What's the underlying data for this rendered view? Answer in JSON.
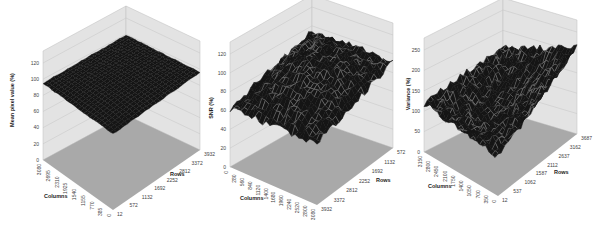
{
  "colors": {
    "wall": "#e3e3e3",
    "wall_edge": "#bdbdbd",
    "gridline": "#c4c4c4",
    "floor": "#a9a9a9",
    "surface": "#151515",
    "surface_speckle": "#7a7a7a",
    "tick_text": "#444444"
  },
  "chart_data": [
    {
      "type": "surface3d",
      "title": "",
      "zlabel": "Mean pixel value (%)",
      "xlabel": "Columns",
      "ylabel": "Rows",
      "zlim": [
        0,
        120
      ],
      "z_ticks": [
        "0",
        "20",
        "40",
        "60",
        "80",
        "100",
        "120"
      ],
      "x_ticks": [
        "3080",
        "2695",
        "2310",
        "1925",
        "1540",
        "1155",
        "770",
        "385",
        "0"
      ],
      "y_ticks": [
        "12",
        "572",
        "1132",
        "1692",
        "2252",
        "2812",
        "3372",
        "3932"
      ],
      "surface_description": "Nearly flat dome; ~95% at edges rising to ~100% near center",
      "approx_corner_values": {
        "left": 95,
        "back": 99,
        "right": 96,
        "front": 94
      },
      "approx_center_value": 100
    },
    {
      "type": "surface3d",
      "title": "",
      "zlabel": "SNR (%)",
      "xlabel": "Columns",
      "ylabel": "Rows",
      "zlim": [
        0,
        120
      ],
      "z_ticks": [
        "0",
        "20",
        "40",
        "60",
        "80",
        "100",
        "120"
      ],
      "x_ticks": [
        "0",
        "280",
        "560",
        "840",
        "1120",
        "1400",
        "1680",
        "1960",
        "2240",
        "2520",
        "2800",
        "3080"
      ],
      "y_ticks": [
        "3932",
        "3372",
        "2812",
        "2252",
        "1692",
        "1132",
        "572"
      ],
      "surface_description": "Noisy dome; ~62% at left corner rising to ~100% near center/back",
      "approx_corner_values": {
        "left": 62,
        "back": 95,
        "right": 92,
        "front": 65
      },
      "approx_center_value": 100
    },
    {
      "type": "surface3d",
      "title": "",
      "zlabel": "Variance (%)",
      "xlabel": "Columns",
      "ylabel": "Rows",
      "zlim": [
        0,
        250
      ],
      "z_ticks": [
        "0",
        "50",
        "100",
        "150",
        "200",
        "250"
      ],
      "x_ticks": [
        "3150",
        "2800",
        "2450",
        "2100",
        "1750",
        "1400",
        "1050",
        "700",
        "350",
        "0"
      ],
      "y_ticks": [
        "12",
        "537",
        "1062",
        "1587",
        "2112",
        "2637",
        "3162",
        "3687"
      ],
      "surface_description": "Noisy bowl; ~100% at center, rising to ~120% left and ~210% at right corner",
      "approx_corner_values": {
        "left": 120,
        "back": 160,
        "right": 210,
        "front": 95
      },
      "approx_center_value": 100
    }
  ]
}
